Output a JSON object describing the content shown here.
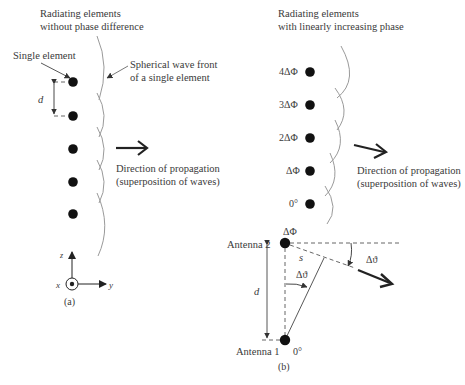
{
  "panel_a": {
    "title_line1": "Radiating elements",
    "title_line2": "without phase difference",
    "single_element_label": "Single element",
    "wavefront_label_line1": "Spherical wave front",
    "wavefront_label_line2": "of a single element",
    "spacing_label": "d",
    "direction_line1": "Direction of propagation",
    "direction_line2": "(superposition of waves)",
    "axis_z": "z",
    "axis_x": "x",
    "axis_y": "y",
    "caption": "(a)",
    "element_count": 5
  },
  "panel_b_top": {
    "title_line1": "Radiating elements",
    "title_line2": "with linearly increasing phase",
    "phase_labels": [
      "4ΔΦ",
      "3ΔΦ",
      "2ΔΦ",
      "ΔΦ",
      "0°"
    ],
    "direction_line1": "Direction of propagation",
    "direction_line2": "(superposition of waves)"
  },
  "panel_b_bottom": {
    "antenna2_label": "Antenna 2",
    "antenna2_phase": "ΔΦ",
    "antenna1_label": "Antenna 1",
    "antenna1_phase": "0°",
    "path_label": "s",
    "spacing_label": "d",
    "angle_label_inner": "Δϑ",
    "angle_label_outer": "Δϑ",
    "caption": "(b)"
  }
}
